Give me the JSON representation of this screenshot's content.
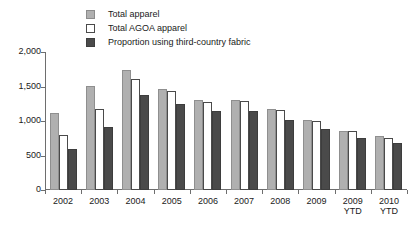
{
  "chart_data": {
    "type": "bar",
    "title": "",
    "subtitle": "",
    "xlabel": "",
    "ylabel": "",
    "ylim": [
      0,
      2000
    ],
    "yticks": [
      "0",
      "500",
      "1,000",
      "1,500",
      "2,000"
    ],
    "ytick_values": [
      0,
      500,
      1000,
      1500,
      2000
    ],
    "grid": false,
    "legend_position": "top",
    "categories": [
      "2002",
      "2003",
      "2004",
      "2005",
      "2006",
      "2007",
      "2008",
      "2009",
      "2009\nYTD",
      "2010\nYTD"
    ],
    "series": [
      {
        "name": "Total apparel",
        "color": "#b0b0b0",
        "values": [
          1120,
          1510,
          1740,
          1470,
          1300,
          1310,
          1180,
          1010,
          860,
          790
        ]
      },
      {
        "name": "Total AGOA apparel",
        "color": "#ffffff",
        "values": [
          800,
          1170,
          1610,
          1430,
          1270,
          1290,
          1160,
          1000,
          850,
          760
        ]
      },
      {
        "name": "Proportion using third-country fabric",
        "color": "#4a4a4a",
        "values": [
          590,
          910,
          1370,
          1240,
          1140,
          1150,
          1010,
          880,
          760,
          680
        ]
      }
    ]
  },
  "legend": {
    "items": [
      {
        "label": "Total apparel",
        "swatch": "total-apparel-swatch"
      },
      {
        "label": "Total AGOA apparel",
        "swatch": "total-agoa-apparel-swatch"
      },
      {
        "label": "Proportion using third-country fabric",
        "swatch": "third-country-fabric-swatch"
      }
    ]
  }
}
